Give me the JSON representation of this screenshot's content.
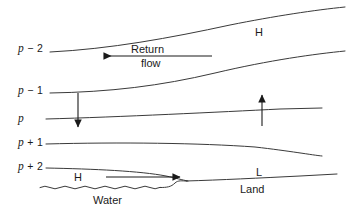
{
  "figure": {
    "type": "cross-section-diagram",
    "background_color": "#ffffff",
    "line_color": "#3a3a3a",
    "text_color": "#1a1a1a",
    "width": 346,
    "height": 219
  },
  "isobar_labels": [
    {
      "id": "p-minus-2",
      "p": "p",
      "suffix": " − 2",
      "x": 18,
      "y": 43
    },
    {
      "id": "p-minus-1",
      "p": "p",
      "suffix": " − 1",
      "x": 18,
      "y": 85
    },
    {
      "id": "p",
      "p": "p",
      "suffix": "",
      "x": 18,
      "y": 113
    },
    {
      "id": "p-plus-1",
      "p": "p",
      "suffix": " + 1",
      "x": 18,
      "y": 137
    },
    {
      "id": "p-plus-2",
      "p": "p",
      "suffix": " + 2",
      "x": 18,
      "y": 161
    }
  ],
  "annotations": {
    "high_upper": {
      "text": "H",
      "x": 255,
      "y": 27
    },
    "high_lower": {
      "text": "H",
      "x": 74,
      "y": 172
    },
    "low": {
      "text": "L",
      "x": 256,
      "y": 167
    },
    "land": {
      "text": "Land",
      "x": 240,
      "y": 184
    },
    "water": {
      "text": "Water",
      "x": 93,
      "y": 194
    },
    "return_flow_line1": {
      "text": "Return",
      "x": 131,
      "y": 45
    },
    "return_flow_line2": {
      "text": "flow",
      "x": 141,
      "y": 59
    }
  },
  "arrows": [
    {
      "id": "return-flow-arrow",
      "direction": "left",
      "x1": 212,
      "y1": 56,
      "x2": 101,
      "y2": 56
    },
    {
      "id": "subsidence-arrow",
      "direction": "down",
      "x1": 78,
      "y1": 93,
      "x2": 78,
      "y2": 130
    },
    {
      "id": "ascent-arrow",
      "direction": "up",
      "x1": 262,
      "y1": 126,
      "x2": 262,
      "y2": 92
    },
    {
      "id": "sea-breeze-arrow",
      "direction": "right",
      "x1": 106,
      "y1": 177,
      "x2": 183,
      "y2": 177
    }
  ],
  "isobar_curves": [
    {
      "id": "curve-p-minus-2",
      "path": "M 50 52 C 110 49 170 38 230 25 S 300 11 345 8"
    },
    {
      "id": "curve-p-minus-1",
      "path": "M 50 93 C 110 92 160 86 215 73 S 300 56 345 52"
    },
    {
      "id": "curve-p",
      "path": "M 46 119 C 120 117 220 112 290 109 L 322 108"
    },
    {
      "id": "curve-p-plus-1",
      "path": "M 46 144 C 120 142 200 143 260 148 S 305 155 322 156"
    },
    {
      "id": "curve-p-plus-2",
      "path": "M 46 168 C 95 169 140 171 165 175 S 180 180 190 181"
    }
  ],
  "surface": {
    "land_path": "M 186 181 C 220 180 260 178 300 176 L 336 174",
    "coast_step_path": "M 160 187 C 168 187 172 186 176 182 C 179 179 182 181 186 181",
    "water_label_side": "left",
    "water_wave_start_x": 40,
    "water_wave_end_x": 160,
    "water_wave_y": 187
  }
}
